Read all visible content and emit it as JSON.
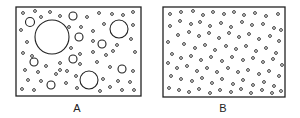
{
  "panels": [
    {
      "label": "A",
      "box": {
        "x": 16,
        "y": 7,
        "w": 125,
        "h": 89
      },
      "label_pos": {
        "x": 77,
        "y": 102
      },
      "circles": [
        {
          "cx": 52,
          "cy": 37,
          "r": 17
        },
        {
          "cx": 119,
          "cy": 29,
          "r": 9
        },
        {
          "cx": 89,
          "cy": 80,
          "r": 9
        },
        {
          "cx": 30,
          "cy": 22,
          "r": 4.5
        },
        {
          "cx": 73,
          "cy": 16,
          "r": 4
        },
        {
          "cx": 79,
          "cy": 37,
          "r": 4
        },
        {
          "cx": 102,
          "cy": 44,
          "r": 4
        },
        {
          "cx": 34,
          "cy": 62,
          "r": 4
        },
        {
          "cx": 73,
          "cy": 59,
          "r": 4
        },
        {
          "cx": 122,
          "cy": 69,
          "r": 4
        },
        {
          "cx": 51,
          "cy": 85,
          "r": 4
        }
      ],
      "dots": [
        [
          23,
          13
        ],
        [
          35,
          11
        ],
        [
          50,
          12
        ],
        [
          60,
          16
        ],
        [
          41,
          17
        ],
        [
          87,
          17
        ],
        [
          99,
          13
        ],
        [
          112,
          14
        ],
        [
          123,
          15
        ],
        [
          133,
          12
        ],
        [
          21,
          30
        ],
        [
          27,
          42
        ],
        [
          69,
          27
        ],
        [
          81,
          27
        ],
        [
          93,
          31
        ],
        [
          104,
          24
        ],
        [
          133,
          25
        ],
        [
          93,
          41
        ],
        [
          117,
          45
        ],
        [
          131,
          39
        ],
        [
          23,
          53
        ],
        [
          71,
          48
        ],
        [
          80,
          54
        ],
        [
          93,
          52
        ],
        [
          106,
          55
        ],
        [
          113,
          51
        ],
        [
          135,
          52
        ],
        [
          25,
          70
        ],
        [
          38,
          72
        ],
        [
          60,
          63
        ],
        [
          80,
          64
        ],
        [
          97,
          62
        ],
        [
          110,
          67
        ],
        [
          133,
          71
        ],
        [
          28,
          80
        ],
        [
          41,
          81
        ],
        [
          60,
          70
        ],
        [
          67,
          71
        ],
        [
          76,
          76
        ],
        [
          103,
          79
        ],
        [
          118,
          81
        ],
        [
          130,
          82
        ],
        [
          22,
          89
        ],
        [
          34,
          90
        ],
        [
          66,
          83
        ],
        [
          77,
          88
        ],
        [
          100,
          91
        ],
        [
          110,
          87
        ],
        [
          122,
          90
        ],
        [
          134,
          90
        ],
        [
          46,
          66
        ],
        [
          56,
          74
        ],
        [
          32,
          56
        ]
      ]
    },
    {
      "label": "B",
      "box": {
        "x": 163,
        "y": 7,
        "w": 122,
        "h": 90
      },
      "label_pos": {
        "x": 223,
        "y": 102
      },
      "circles": [],
      "dots": [
        [
          170,
          14
        ],
        [
          181,
          12
        ],
        [
          193,
          11
        ],
        [
          203,
          15
        ],
        [
          213,
          12
        ],
        [
          224,
          14
        ],
        [
          234,
          12
        ],
        [
          244,
          15
        ],
        [
          255,
          13
        ],
        [
          266,
          16
        ],
        [
          278,
          14
        ],
        [
          170,
          26
        ],
        [
          180,
          21
        ],
        [
          191,
          24
        ],
        [
          200,
          22
        ],
        [
          210,
          26
        ],
        [
          221,
          23
        ],
        [
          231,
          27
        ],
        [
          242,
          22
        ],
        [
          252,
          25
        ],
        [
          263,
          24
        ],
        [
          274,
          28
        ],
        [
          281,
          30
        ],
        [
          178,
          35
        ],
        [
          189,
          32
        ],
        [
          199,
          36
        ],
        [
          209,
          33
        ],
        [
          219,
          38
        ],
        [
          229,
          33
        ],
        [
          239,
          37
        ],
        [
          249,
          34
        ],
        [
          259,
          39
        ],
        [
          270,
          36
        ],
        [
          279,
          41
        ],
        [
          168,
          42
        ],
        [
          184,
          44
        ],
        [
          195,
          48
        ],
        [
          205,
          45
        ],
        [
          215,
          50
        ],
        [
          226,
          46
        ],
        [
          236,
          49
        ],
        [
          246,
          46
        ],
        [
          256,
          51
        ],
        [
          266,
          48
        ],
        [
          276,
          53
        ],
        [
          172,
          54
        ],
        [
          181,
          58
        ],
        [
          191,
          56
        ],
        [
          201,
          60
        ],
        [
          211,
          57
        ],
        [
          222,
          61
        ],
        [
          232,
          57
        ],
        [
          243,
          60
        ],
        [
          253,
          58
        ],
        [
          263,
          62
        ],
        [
          273,
          59
        ],
        [
          282,
          65
        ],
        [
          168,
          63
        ],
        [
          177,
          68
        ],
        [
          187,
          66
        ],
        [
          197,
          71
        ],
        [
          207,
          68
        ],
        [
          217,
          72
        ],
        [
          228,
          68
        ],
        [
          238,
          72
        ],
        [
          248,
          70
        ],
        [
          259,
          74
        ],
        [
          269,
          71
        ],
        [
          279,
          76
        ],
        [
          171,
          76
        ],
        [
          181,
          79
        ],
        [
          192,
          81
        ],
        [
          202,
          78
        ],
        [
          212,
          83
        ],
        [
          222,
          79
        ],
        [
          233,
          84
        ],
        [
          243,
          80
        ],
        [
          253,
          85
        ],
        [
          264,
          82
        ],
        [
          274,
          86
        ],
        [
          169,
          88
        ],
        [
          179,
          90
        ],
        [
          189,
          92
        ],
        [
          199,
          89
        ],
        [
          210,
          93
        ],
        [
          220,
          90
        ],
        [
          231,
          92
        ],
        [
          241,
          89
        ],
        [
          251,
          93
        ],
        [
          262,
          90
        ],
        [
          272,
          93
        ],
        [
          281,
          91
        ]
      ]
    }
  ],
  "style": {
    "stroke": "#222222",
    "background": "#ffffff"
  }
}
